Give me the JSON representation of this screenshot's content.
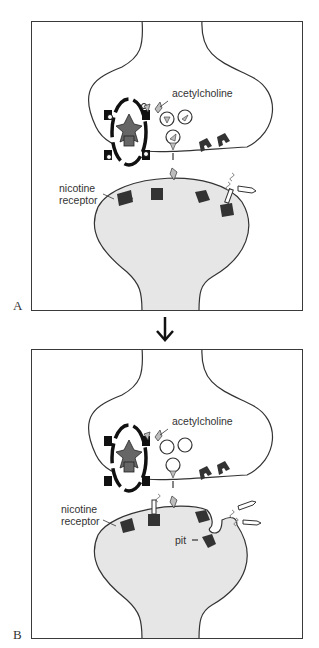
{
  "panels": [
    {
      "letter": "A",
      "labels": {
        "neurotransmitter": "acetylcholine",
        "receptor_line1": "nicotine",
        "receptor_line2": "receptor"
      }
    },
    {
      "letter": "B",
      "labels": {
        "neurotransmitter": "acetylcholine",
        "receptor_line1": "nicotine",
        "receptor_line2": "receptor",
        "pit": "pit"
      }
    }
  ],
  "transition_arrow": "down-arrow",
  "colors": {
    "frame": "#3a3a3a",
    "cell_fill": "#e6e6e6",
    "cell_outline": "#333333",
    "receptor": "#333333",
    "vesicle_fill": "#ffffff",
    "molecule": "#bdbdbd"
  }
}
